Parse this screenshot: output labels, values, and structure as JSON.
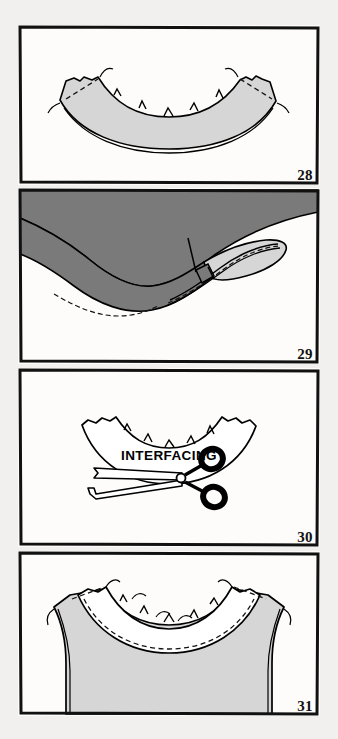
{
  "page": {
    "background_color": "#f2f0ee",
    "panel_background": "#fdfcfb",
    "border_color": "#111111",
    "ink_color": "#000000",
    "fabric_light_gray": "#d6d6d6",
    "fabric_dark_gray": "#7a7a7a",
    "facing_white": "#ffffff"
  },
  "panels": [
    {
      "number": "28",
      "name": "facing-stitched-at-shoulder",
      "fill": "#d6d6d6",
      "description": "Curved neckline facing piece, light gray, shoulder seams stitched with dashed stitching lines, clipped notches along upper curved edge, thread tails at both outer corners"
    },
    {
      "number": "29",
      "name": "facing-understitched-to-seam-allowance",
      "fill": "#7a7a7a",
      "facing_fill": "#d6d6d6",
      "description": "Dark gray garment with light gray facing rolled to inside, dashed understitching line along rolled edge, small clip tab detail at center"
    },
    {
      "number": "30",
      "name": "trim-interfacing-with-scissors",
      "label": "INTERFACING",
      "fill": "#ffffff",
      "description": "White outlined curved interfacing piece with notched edge being trimmed close to stitching by scissors"
    },
    {
      "number": "31",
      "name": "facing-attached-to-bodice-neckline",
      "fill": "#d6d6d6",
      "facing_fill": "#ffffff",
      "description": "Sleeveless bodice front, light gray, white neckline facing band stitched and clipped, dashed stitching around neckline and shoulders, thread tails at armhole corners"
    }
  ]
}
